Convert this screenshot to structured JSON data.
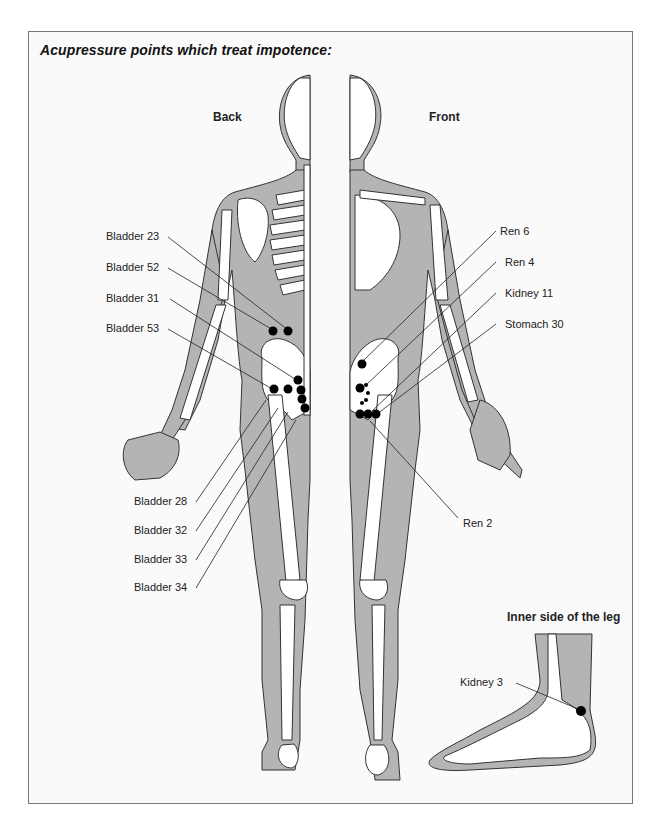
{
  "title": "Acupressure points which treat impotence:",
  "views": {
    "back": "Back",
    "front": "Front",
    "inset": "Inner side of the leg"
  },
  "colors": {
    "flesh": "#b4b4b4",
    "bone": "#ffffff",
    "outline": "#333333",
    "point": "#000000",
    "background": "#fafafa"
  },
  "back_points": {
    "left_labels": [
      {
        "id": "bladder-23",
        "label": "Bladder 23"
      },
      {
        "id": "bladder-52",
        "label": "Bladder 52"
      },
      {
        "id": "bladder-31",
        "label": "Bladder 31"
      },
      {
        "id": "bladder-53",
        "label": "Bladder 53"
      },
      {
        "id": "bladder-28",
        "label": "Bladder 28"
      },
      {
        "id": "bladder-32",
        "label": "Bladder 32"
      },
      {
        "id": "bladder-33",
        "label": "Bladder 33"
      },
      {
        "id": "bladder-34",
        "label": "Bladder 34"
      }
    ]
  },
  "front_points": {
    "right_labels": [
      {
        "id": "ren-6",
        "label": "Ren 6"
      },
      {
        "id": "ren-4",
        "label": "Ren 4"
      },
      {
        "id": "kidney-11",
        "label": "Kidney 11"
      },
      {
        "id": "stomach-30",
        "label": "Stomach 30"
      },
      {
        "id": "ren-2",
        "label": "Ren 2"
      }
    ]
  },
  "inset_points": [
    {
      "id": "kidney-3",
      "label": "Kidney 3"
    }
  ]
}
